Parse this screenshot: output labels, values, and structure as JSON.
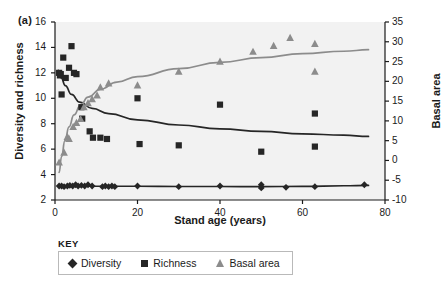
{
  "figure": {
    "panel_label": "(a)",
    "plot_bg": "#f2f2f2",
    "axis_color": "#1a1a1a"
  },
  "chart_data": {
    "type": "scatter",
    "title": "",
    "xlabel": "Stand age (years)",
    "ylabel": "Diversity and richness",
    "y2label": "Basal area",
    "xlim": [
      0,
      80
    ],
    "ylim": [
      2,
      16
    ],
    "y2lim": [
      -10,
      35
    ],
    "xticks": [
      0,
      20,
      40,
      60,
      80
    ],
    "yticks": [
      2,
      4,
      6,
      8,
      10,
      12,
      14,
      16
    ],
    "y2ticks": [
      -10,
      -5,
      0,
      5,
      10,
      15,
      20,
      25,
      30,
      35
    ],
    "grid": false,
    "legend_position": "below",
    "legend_title": "KEY",
    "series": [
      {
        "name": "Diversity",
        "marker": "diamond",
        "color": "#262626",
        "axis": "left",
        "points": [
          [
            1.0,
            3.1
          ],
          [
            1.6,
            3.1
          ],
          [
            2.2,
            3.05
          ],
          [
            3.0,
            3.1
          ],
          [
            3.6,
            3.15
          ],
          [
            4.3,
            3.1
          ],
          [
            5.0,
            3.2
          ],
          [
            5.6,
            3.1
          ],
          [
            6.4,
            3.15
          ],
          [
            7.2,
            3.1
          ],
          [
            8.0,
            3.2
          ],
          [
            9.0,
            3.1
          ],
          [
            11.5,
            3.05
          ],
          [
            12.2,
            3.1
          ],
          [
            13.0,
            3.05
          ],
          [
            13.8,
            3.1
          ],
          [
            14.5,
            3.05
          ],
          [
            20.0,
            3.1
          ],
          [
            30.0,
            3.05
          ],
          [
            40.0,
            3.1
          ],
          [
            50.0,
            3.2
          ],
          [
            50.0,
            2.95
          ],
          [
            56.0,
            3.0
          ],
          [
            63.0,
            3.05
          ],
          [
            75.0,
            3.2
          ]
        ]
      },
      {
        "name": "Richness",
        "marker": "square",
        "color": "#262626",
        "axis": "left",
        "points": [
          [
            1.0,
            12.0
          ],
          [
            1.2,
            11.8
          ],
          [
            1.4,
            11.9
          ],
          [
            1.6,
            10.3
          ],
          [
            2.0,
            13.2
          ],
          [
            2.6,
            11.6
          ],
          [
            3.4,
            12.4
          ],
          [
            4.0,
            14.1
          ],
          [
            4.6,
            12.0
          ],
          [
            5.2,
            11.9
          ],
          [
            6.4,
            9.3
          ],
          [
            6.6,
            8.4
          ],
          [
            8.4,
            7.4
          ],
          [
            9.2,
            6.9
          ],
          [
            11.0,
            6.9
          ],
          [
            12.6,
            6.8
          ],
          [
            20.0,
            10.0
          ],
          [
            20.5,
            6.4
          ],
          [
            30.0,
            6.3
          ],
          [
            40.0,
            9.5
          ],
          [
            50.0,
            5.8
          ],
          [
            63.0,
            8.8
          ],
          [
            63.0,
            6.2
          ]
        ]
      },
      {
        "name": "Basal area",
        "marker": "triangle",
        "color": "#8c8c8c",
        "axis": "right",
        "points": [
          [
            1.0,
            -0.5
          ],
          [
            2.2,
            2.0
          ],
          [
            3.0,
            6.0
          ],
          [
            3.4,
            5.5
          ],
          [
            4.4,
            8.5
          ],
          [
            5.2,
            9.5
          ],
          [
            6.2,
            10.5
          ],
          [
            7.0,
            13.5
          ],
          [
            8.0,
            14.5
          ],
          [
            9.0,
            15.5
          ],
          [
            10.2,
            16.5
          ],
          [
            11.0,
            18.5
          ],
          [
            13.0,
            19.5
          ],
          [
            20.0,
            19.0
          ],
          [
            30.0,
            22.5
          ],
          [
            40.0,
            25.0
          ],
          [
            48.0,
            27.5
          ],
          [
            53.0,
            29.0
          ],
          [
            57.0,
            31.0
          ],
          [
            63.0,
            29.5
          ],
          [
            63.0,
            22.5
          ]
        ]
      }
    ],
    "fitted_curves": [
      {
        "name": "richness-fit",
        "color": "#262626",
        "axis": "left",
        "points": [
          [
            0.8,
            12.2
          ],
          [
            1.5,
            11.6
          ],
          [
            2.5,
            11.0
          ],
          [
            4.0,
            10.3
          ],
          [
            6.0,
            9.7
          ],
          [
            9.0,
            9.2
          ],
          [
            13.0,
            8.8
          ],
          [
            20.0,
            8.3
          ],
          [
            30.0,
            7.9
          ],
          [
            40.0,
            7.6
          ],
          [
            50.0,
            7.4
          ],
          [
            60.0,
            7.2
          ],
          [
            70.0,
            7.1
          ],
          [
            76.0,
            7.0
          ]
        ]
      },
      {
        "name": "basal-area-fit",
        "color": "#8c8c8c",
        "axis": "right",
        "points": [
          [
            1.0,
            -3.0
          ],
          [
            1.6,
            1.0
          ],
          [
            2.4,
            5.0
          ],
          [
            3.4,
            8.5
          ],
          [
            4.6,
            11.5
          ],
          [
            6.2,
            14.0
          ],
          [
            8.0,
            16.0
          ],
          [
            11.0,
            18.0
          ],
          [
            15.0,
            19.8
          ],
          [
            20.0,
            21.2
          ],
          [
            30.0,
            23.2
          ],
          [
            40.0,
            24.8
          ],
          [
            50.0,
            26.0
          ],
          [
            60.0,
            27.0
          ],
          [
            70.0,
            27.6
          ],
          [
            76.0,
            28.0
          ]
        ]
      },
      {
        "name": "diversity-fit",
        "color": "#262626",
        "axis": "left",
        "points": [
          [
            1.0,
            3.1
          ],
          [
            5.0,
            3.1
          ],
          [
            10.0,
            3.08
          ],
          [
            20.0,
            3.08
          ],
          [
            30.0,
            3.06
          ],
          [
            40.0,
            3.06
          ],
          [
            50.0,
            3.05
          ],
          [
            60.0,
            3.07
          ],
          [
            70.0,
            3.12
          ],
          [
            76.0,
            3.15
          ]
        ]
      }
    ]
  },
  "legend": {
    "title": "KEY",
    "items": [
      {
        "label": "Diversity",
        "marker": "diamond",
        "color": "#262626"
      },
      {
        "label": "Richness",
        "marker": "square",
        "color": "#262626"
      },
      {
        "label": "Basal area",
        "marker": "triangle",
        "color": "#8c8c8c"
      }
    ]
  }
}
